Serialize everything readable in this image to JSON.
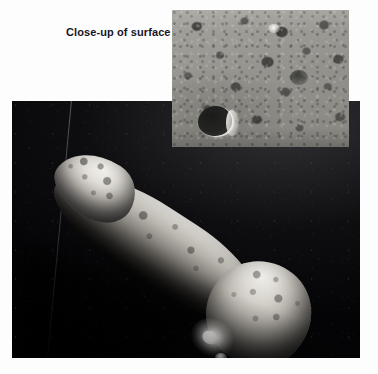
{
  "figure": {
    "background_color": "#fdfdfd",
    "caption": {
      "text": "Close-up of surface",
      "color": "#161626",
      "bold": true
    },
    "main_photo": {
      "name": "asteroid-photograph",
      "subject": "elongated asteroid",
      "alt": "Elongated, heavily cratered asteroid lit from the upper right against black space",
      "background_color": "#07070a",
      "body_highlight_color": "#e8e6e2",
      "shadow_color": "#040406",
      "features": {
        "nose": "cratered end at upper left",
        "shaft": "long ridged mid-body running diagonally",
        "lobe": "rounded bulge at lower right",
        "ray_crater": "bright rayed crater near mid-body",
        "scan_line": "faint diagonal sensor artifact at left"
      }
    },
    "inset_photo": {
      "name": "surface-close-up",
      "alt": "Close-up of the asteroid's gray regolith surface strewn with boulders and small craters",
      "surface_color": "#96958f",
      "features": {
        "large_crater": "dark crater with bright sunlit rim at lower left",
        "texture": "fine regolith speckled with dark boulders"
      }
    }
  }
}
